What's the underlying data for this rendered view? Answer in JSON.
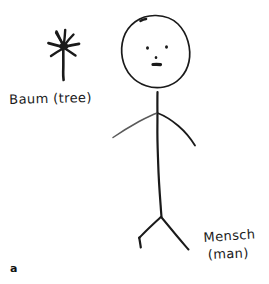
{
  "panel": {
    "letter": "a",
    "background_color": "#ffffff",
    "ink_color": "#1a1a1a",
    "soft_ink_color": "#5a5a5a",
    "width": 269,
    "height": 284
  },
  "labels": {
    "tree": {
      "text": "Baum (tree)",
      "german": "Baum",
      "english": "(tree)"
    },
    "man": {
      "german": "Mensch",
      "english": "(man)"
    }
  },
  "drawings": {
    "tree": {
      "name": "tree-sketch",
      "description": "star-like tree with vertical trunk and radiating branches"
    },
    "person": {
      "name": "stick-figure-sketch",
      "description": "stick figure with oval head, two dot eyes, nose, mouth, single-line torso, arched arms and V-shaped legs"
    }
  }
}
